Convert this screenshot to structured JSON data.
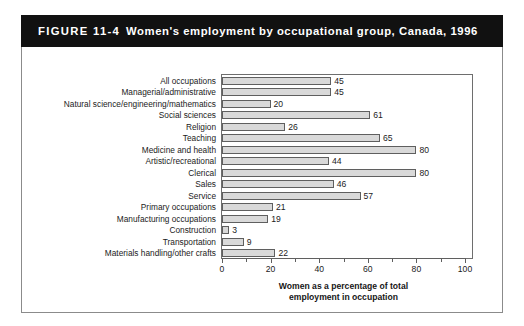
{
  "figure": {
    "number": "FIGURE 11-4",
    "title": "Women's employment by occupational group, Canada, 1996"
  },
  "chart_data": {
    "type": "bar",
    "orientation": "horizontal",
    "title": "Women's employment by occupational group, Canada, 1996",
    "xlabel_line1": "Women as a percentage of total",
    "xlabel_line2": "employment in occupation",
    "ylabel": "",
    "xlim": [
      0,
      100
    ],
    "xticks": [
      0,
      20,
      40,
      60,
      80,
      100
    ],
    "xtick_labels": [
      "0",
      "20",
      "40",
      "60",
      "80",
      "100"
    ],
    "minor_xticks": [
      10,
      30,
      50,
      70,
      90
    ],
    "grid": false,
    "legend": false,
    "bar_fill_color": "#d9d9d9",
    "bar_edge_color": "#5f5f5f",
    "categories": [
      "All occupations",
      "Managerial/administrative",
      "Natural science/engineering/mathematics",
      "Social sciences",
      "Religion",
      "Teaching",
      "Medicine and health",
      "Artistic/recreational",
      "Clerical",
      "Sales",
      "Service",
      "Primary occupations",
      "Manufacturing occupations",
      "Construction",
      "Transportation",
      "Materials handling/other crafts"
    ],
    "values": [
      45,
      45,
      20,
      61,
      26,
      65,
      80,
      44,
      80,
      46,
      57,
      21,
      19,
      3,
      9,
      22
    ],
    "value_labels": [
      "45",
      "45",
      "20",
      "61",
      "26",
      "65",
      "80",
      "44",
      "80",
      "46",
      "57",
      "21",
      "19",
      "3",
      "9",
      "22"
    ]
  },
  "colors": {
    "banner_background": "#111111",
    "banner_text": "#ffffff",
    "frame": "#8b8b8b",
    "axis": "#5f5f5f",
    "text": "#1b1b1b"
  }
}
